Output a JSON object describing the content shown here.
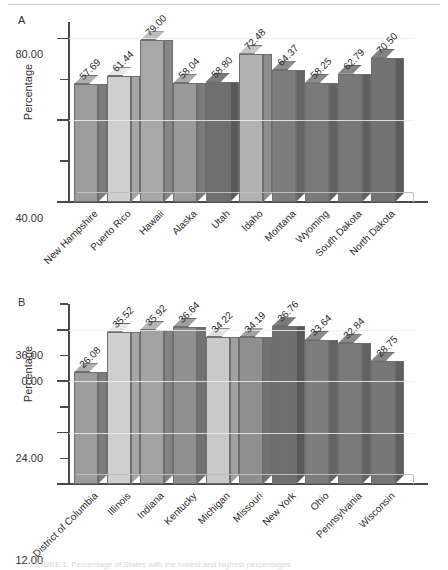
{
  "figure": {
    "top_rule": true,
    "panels": [
      "A",
      "B"
    ]
  },
  "panel_a": {
    "letter": "A",
    "ylabel": "Percentage",
    "yticks": [
      "0.00",
      "40.00",
      "80.00"
    ]
  },
  "panel_b": {
    "letter": "B",
    "ylabel": "Percentage",
    "yticks": [
      "0.00",
      "12.00",
      "24.00",
      "36.00"
    ]
  },
  "chart_data": [
    {
      "type": "bar",
      "panel": "A",
      "title": "",
      "xlabel": "",
      "ylabel": "Percentage",
      "ylim": [
        0,
        88
      ],
      "yticks": [
        0,
        40,
        80
      ],
      "minor_ticks": true,
      "grid": true,
      "legend": "none",
      "bar_style": "3d",
      "categories": [
        "New Hampshire",
        "Puerto Rico",
        "Hawaii",
        "Alaska",
        "Utah",
        "Idaho",
        "Montana",
        "Wyoming",
        "South Dakota",
        "North Dakota"
      ],
      "values": [
        57.69,
        61.44,
        79.0,
        58.04,
        58.8,
        72.48,
        64.37,
        58.25,
        62.79,
        70.5
      ],
      "value_labels": [
        "57.69",
        "61.44",
        "79.00",
        "58.04",
        "58.80",
        "72.48",
        "64.37",
        "58.25",
        "62.79",
        "70.50"
      ],
      "bar_colors": [
        "#9c9c9c",
        "#cfcfcf",
        "#a8a8a8",
        "#9a9a9a",
        "#6f6f6f",
        "#b2b2b2",
        "#7d7d7d",
        "#7a7a7a",
        "#787878",
        "#737373"
      ]
    },
    {
      "type": "bar",
      "panel": "B",
      "title": "",
      "xlabel": "",
      "ylabel": "Percentage",
      "ylim": [
        0,
        42
      ],
      "yticks": [
        0,
        12,
        24,
        36
      ],
      "minor_ticks": true,
      "grid": true,
      "legend": "none",
      "bar_style": "3d",
      "categories": [
        "District of Columbia",
        "Illinois",
        "Indiana",
        "Kentucky",
        "Michigan",
        "Missouri",
        "New York",
        "Ohio",
        "Pennsylvania",
        "Wisconsin"
      ],
      "values": [
        26.08,
        35.52,
        35.92,
        36.64,
        34.22,
        34.19,
        36.76,
        33.64,
        32.84,
        28.75
      ],
      "value_labels": [
        "26.08",
        "35.52",
        "35.92",
        "36.64",
        "34.22",
        "34.19",
        "36.76",
        "33.64",
        "32.84",
        "28.75"
      ],
      "bar_colors": [
        "#9c9c9c",
        "#cfcfcf",
        "#a3a3a3",
        "#8f8f8f",
        "#c9c9c9",
        "#8f8f8f",
        "#6f6f6f",
        "#7d7d7d",
        "#7a7a7a",
        "#777777"
      ]
    }
  ],
  "caption": {
    "text": "FIGURE 1. Percentage of States with the lowest and highest percentages"
  }
}
